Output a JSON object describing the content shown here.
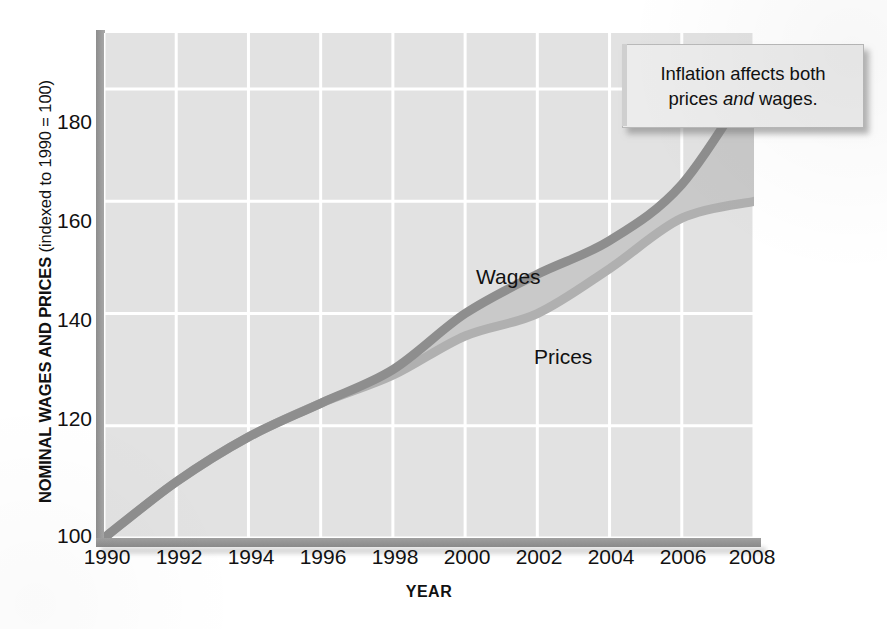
{
  "chart_data": {
    "type": "line",
    "title": "",
    "xlabel": "YEAR",
    "ylabel": "NOMINAL WAGES AND PRICES (indexed to 1990 = 100)",
    "ylabel_bold_part": "NOMINAL WAGES AND PRICES",
    "ylabel_regular_part": "(indexed to 1990 = 100)",
    "x": [
      1990,
      1992,
      1994,
      1996,
      1998,
      2000,
      2002,
      2004,
      2006,
      2008
    ],
    "categories": [
      "1990",
      "1992",
      "1994",
      "1996",
      "1998",
      "2000",
      "2002",
      "2004",
      "2006",
      "2008"
    ],
    "series": [
      {
        "name": "Wages",
        "color": "#8e8e8e",
        "values": [
          100,
          110,
          118,
          124,
          130,
          140,
          147,
          153,
          163,
          182
        ]
      },
      {
        "name": "Prices",
        "color": "#b0b0b0",
        "values": [
          100,
          110,
          118,
          124,
          129,
          136,
          140,
          148,
          157,
          160
        ]
      }
    ],
    "xlim": [
      1990,
      2008
    ],
    "ylim": [
      100,
      190
    ],
    "yticks": [
      100,
      120,
      140,
      160,
      180
    ],
    "ytick_labels": [
      "100",
      "120",
      "140",
      "160",
      "180"
    ],
    "xticks": [
      1990,
      1992,
      1994,
      1996,
      1998,
      2000,
      2002,
      2004,
      2006,
      2008
    ],
    "grid": true,
    "grid_color": "#ffffff",
    "plot_background": "#e2e2e2",
    "fill_between_color": "#c9c9c9",
    "legend": "inline-labels",
    "legend_position": "on-plot",
    "annotations": [
      {
        "name": "inflation-callout",
        "line1": "Inflation affects both",
        "line2_before": "prices ",
        "line2_italic": "and",
        "line2_after": " wages.",
        "text": "Inflation affects both prices and wages."
      }
    ]
  },
  "labels": {
    "wages": "Wages",
    "prices": "Prices"
  },
  "yticks": [
    {
      "label": "180"
    },
    {
      "label": "160"
    },
    {
      "label": "140"
    },
    {
      "label": "120"
    },
    {
      "label": "100"
    }
  ],
  "xticks": [
    {
      "label": "1990"
    },
    {
      "label": "1992"
    },
    {
      "label": "1994"
    },
    {
      "label": "1996"
    },
    {
      "label": "1998"
    },
    {
      "label": "2000"
    },
    {
      "label": "2002"
    },
    {
      "label": "2004"
    },
    {
      "label": "2006"
    },
    {
      "label": "2008"
    }
  ],
  "axis": {
    "x_title": "YEAR",
    "y_title_bold": "NOMINAL WAGES AND PRICES",
    "y_title_regular": "(indexed to 1990 = 100)"
  },
  "callout": {
    "line1": "Inflation affects both",
    "line2_before": "prices ",
    "line2_italic": "and",
    "line2_after": " wages."
  }
}
